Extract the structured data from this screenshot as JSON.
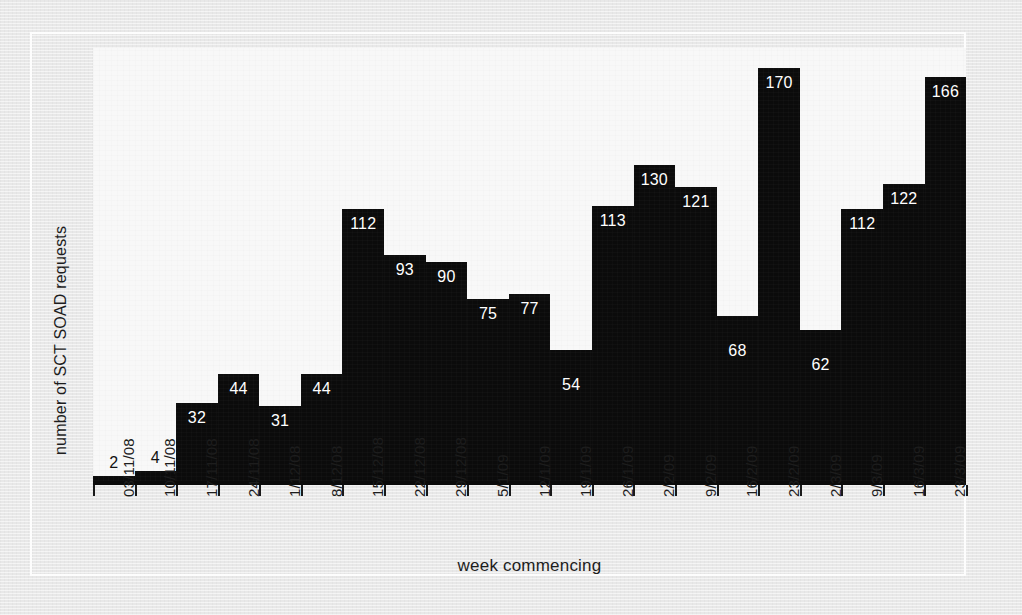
{
  "chart_data": {
    "type": "bar",
    "title": "",
    "xlabel": "week commencing",
    "ylabel": "number of SCT SOAD requests",
    "grid": false,
    "legend": "none",
    "ylim": [
      0,
      180
    ],
    "categories": [
      "03/11/08",
      "10/11/08",
      "17/11/08",
      "24/11/08",
      "1/12/08",
      "8/12/08",
      "15/12/08",
      "22/12/08",
      "29/12/08",
      "5/1/09",
      "12/1/09",
      "19/1/09",
      "26/1/09",
      "2/2/09",
      "9/2/09",
      "16/2/09",
      "23/2/09",
      "2/3/09",
      "9/3/09",
      "16/3/09",
      "23/3/09"
    ],
    "values": [
      2,
      4,
      32,
      44,
      31,
      44,
      112,
      93,
      90,
      75,
      77,
      54,
      113,
      130,
      121,
      68,
      170,
      62,
      112,
      122,
      166
    ],
    "data_labels": [
      "2",
      "4",
      "32",
      "44",
      "31",
      "44",
      "112",
      "93",
      "90",
      "75",
      "77",
      "54",
      "113",
      "130",
      "121",
      "68",
      "170",
      "62",
      "112",
      "122",
      "166"
    ],
    "colors": {
      "bar": "#0b0b0b",
      "panel": "#f8f8f8",
      "margin": "#e8e8e8",
      "label_on_bar": "#ffffff",
      "label_off_bar": "#111111"
    }
  },
  "axis": {
    "x_title": "week commencing",
    "y_title": "number of SCT SOAD requests"
  }
}
